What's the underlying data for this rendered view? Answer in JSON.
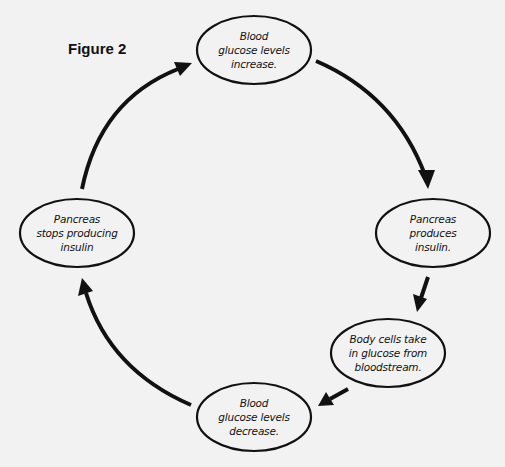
{
  "figure": {
    "title": "Figure 2"
  },
  "colors": {
    "background": "#f2f2f2",
    "stroke": "#111111"
  },
  "nodes": [
    {
      "id": "blood-glucose-increase",
      "lines": [
        "Blood",
        "glucose levels",
        "increase."
      ],
      "cx": 254,
      "cy": 50,
      "rx": 57,
      "ry": 34
    },
    {
      "id": "pancreas-produces-insulin",
      "lines": [
        "Pancreas",
        "produces",
        "insulin."
      ],
      "cx": 433,
      "cy": 233,
      "rx": 57,
      "ry": 34
    },
    {
      "id": "body-cells-take-in-glucose",
      "lines": [
        "Body cells take",
        "in glucose from",
        "bloodstream."
      ],
      "cx": 388,
      "cy": 353,
      "rx": 57,
      "ry": 34
    },
    {
      "id": "blood-glucose-decrease",
      "lines": [
        "Blood",
        "glucose levels",
        "decrease."
      ],
      "cx": 254,
      "cy": 417,
      "rx": 57,
      "ry": 34
    },
    {
      "id": "pancreas-stops-insulin",
      "lines": [
        "Pancreas",
        "stops producing",
        "insulin"
      ],
      "cx": 77,
      "cy": 233,
      "rx": 57,
      "ry": 34
    }
  ],
  "edges": [
    {
      "from": "blood-glucose-increase",
      "to": "pancreas-produces-insulin",
      "type": "curved"
    },
    {
      "from": "pancreas-produces-insulin",
      "to": "body-cells-take-in-glucose",
      "type": "straight"
    },
    {
      "from": "body-cells-take-in-glucose",
      "to": "blood-glucose-decrease",
      "type": "straight"
    },
    {
      "from": "blood-glucose-decrease",
      "to": "pancreas-stops-insulin",
      "type": "curved"
    },
    {
      "from": "pancreas-stops-insulin",
      "to": "blood-glucose-increase",
      "type": "curved"
    }
  ]
}
